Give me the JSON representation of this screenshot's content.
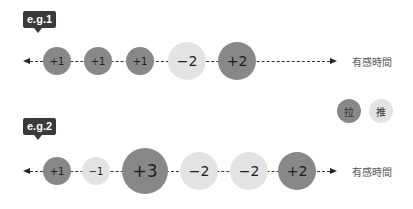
{
  "examples": [
    {
      "badge": "e.g.1",
      "axis_label": "有感時間",
      "circles": [
        {
          "label": "+1",
          "type": "pull"
        },
        {
          "label": "+1",
          "type": "pull"
        },
        {
          "label": "+1",
          "type": "pull"
        },
        {
          "label": "−2",
          "type": "push"
        },
        {
          "label": "+2",
          "type": "pull"
        }
      ]
    },
    {
      "badge": "e.g.2",
      "axis_label": "有感時間",
      "circles": [
        {
          "label": "+1",
          "type": "pull"
        },
        {
          "label": "−1",
          "type": "push"
        },
        {
          "label": "+3",
          "type": "pull"
        },
        {
          "label": "−2",
          "type": "push"
        },
        {
          "label": "−2",
          "type": "push"
        },
        {
          "label": "+2",
          "type": "pull"
        }
      ]
    }
  ],
  "legend": {
    "pull": {
      "label": "拉",
      "color": "#888888"
    },
    "push": {
      "label": "推",
      "color": "#e3e3e3"
    }
  }
}
